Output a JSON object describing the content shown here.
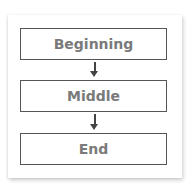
{
  "diagram": {
    "type": "flowchart",
    "steps": [
      {
        "label": "Beginning"
      },
      {
        "label": "Middle"
      },
      {
        "label": "End"
      }
    ],
    "connectors": [
      {
        "from": "Beginning",
        "to": "Middle",
        "icon": "arrow-down-icon"
      },
      {
        "from": "Middle",
        "to": "End",
        "icon": "arrow-down-icon"
      }
    ],
    "colors": {
      "box_border": "#555555",
      "text": "#7a7a7a",
      "arrow": "#444444",
      "background": "#ffffff"
    }
  }
}
